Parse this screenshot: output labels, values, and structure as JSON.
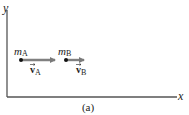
{
  "diagram": {
    "axes": {
      "x_label": "x",
      "y_label": "y"
    },
    "objects": [
      {
        "id": "A",
        "mass_symbol": "m",
        "mass_subscript": "A",
        "velocity_symbol": "v",
        "velocity_subscript": "A",
        "position": [
          21,
          60
        ],
        "arrow_end_x": 55
      },
      {
        "id": "B",
        "mass_symbol": "m",
        "mass_subscript": "B",
        "velocity_symbol": "v",
        "velocity_subscript": "B",
        "position": [
          66,
          60
        ],
        "arrow_end_x": 84
      }
    ],
    "caption": "(a)",
    "colors": {
      "axis": "#555555",
      "arrow": "#808080",
      "dot": "#111111",
      "text": "#222222"
    }
  }
}
